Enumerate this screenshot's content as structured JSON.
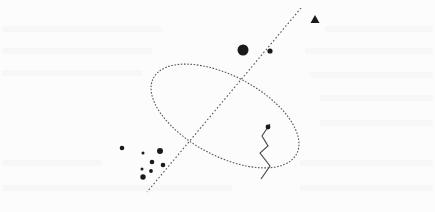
{
  "figure": {
    "width": 435,
    "height": 212,
    "background": "#fcfcfc",
    "ink": "#1a1a1a",
    "dotted_stroke": "#555555"
  },
  "shapes": {
    "axis_line": {
      "x1": 301,
      "y1": 8,
      "x2": 147,
      "y2": 192,
      "style": "dotted"
    },
    "ellipse": {
      "cx": 225,
      "cy": 116,
      "rx": 81,
      "ry": 40,
      "rotation": 28,
      "style": "dotted"
    },
    "triangle": {
      "cx": 315,
      "cy": 19,
      "size": 9
    },
    "large_dot": {
      "cx": 243,
      "cy": 50,
      "r": 5.5
    },
    "small_dot": {
      "cx": 270,
      "cy": 51,
      "r": 2.6
    },
    "zigzag": {
      "points": [
        [
          270,
          124
        ],
        [
          268,
          127
        ],
        [
          262,
          136
        ],
        [
          268,
          146
        ],
        [
          260,
          153
        ],
        [
          270,
          166
        ],
        [
          261,
          179
        ]
      ],
      "end_dot": {
        "cx": 268,
        "cy": 127,
        "r": 2.4
      }
    },
    "cluster": [
      {
        "cx": 122,
        "cy": 148,
        "r": 2.3
      },
      {
        "cx": 143,
        "cy": 153,
        "r": 1.5
      },
      {
        "cx": 160,
        "cy": 151,
        "r": 3.0
      },
      {
        "cx": 152,
        "cy": 162,
        "r": 2.3
      },
      {
        "cx": 163,
        "cy": 165,
        "r": 2.3
      },
      {
        "cx": 142,
        "cy": 169,
        "r": 1.5
      },
      {
        "cx": 151,
        "cy": 171,
        "r": 1.9
      },
      {
        "cx": 143,
        "cy": 177,
        "r": 2.7
      }
    ]
  }
}
